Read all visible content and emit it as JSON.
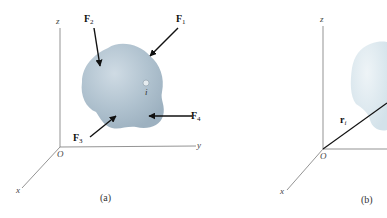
{
  "figure": {
    "panels": [
      {
        "id": "a",
        "caption": "(a)",
        "axes": {
          "x": "x",
          "y": "y",
          "z": "z",
          "origin": "O"
        },
        "forces": [
          {
            "symbol": "F",
            "sub": "1"
          },
          {
            "symbol": "F",
            "sub": "2"
          },
          {
            "symbol": "F",
            "sub": "3"
          },
          {
            "symbol": "F",
            "sub": "4"
          }
        ],
        "particle_label": "i"
      },
      {
        "id": "b",
        "caption": "(b)",
        "axes": {
          "x": "x",
          "z": "z",
          "origin": "O"
        },
        "position_vector": {
          "symbol": "r",
          "sub": "i"
        }
      }
    ],
    "colors": {
      "body_fill": "#a9bccb",
      "body_highlight": "#cfdbe4",
      "body_b_fill": "#dfe9ef",
      "axis_line": "#555555",
      "arrow": "#111111"
    }
  }
}
